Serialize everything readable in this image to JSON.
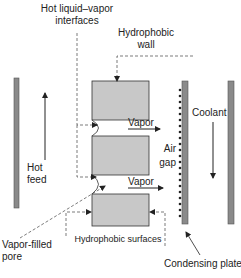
{
  "diagram": {
    "type": "air-gap membrane distillation schematic",
    "labels": {
      "interfaces_line1": "Hot liquid–vapor",
      "interfaces_line2": "interfaces",
      "wall_line1": "Hydrophobic",
      "wall_line2": "wall",
      "vapor_top": "Vapor",
      "vapor_bottom": "Vapor",
      "air_gap_line1": "Air",
      "air_gap_line2": "gap",
      "coolant": "Coolant",
      "hot_feed_line1": "Hot",
      "hot_feed_line2": "feed",
      "pore_line1": "Vapor-filled",
      "pore_line2": "pore",
      "surfaces": "Hydrophobic surfaces",
      "plate": "Condensing plate"
    },
    "colors": {
      "membrane_fill": "#c8c8c8",
      "plate_fill": "#8a8a8a",
      "line": "#222222",
      "dash": "#444444"
    }
  }
}
